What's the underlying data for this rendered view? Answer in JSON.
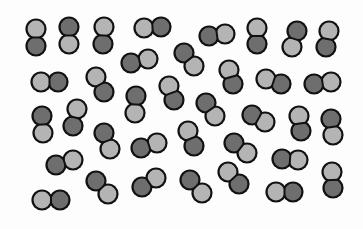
{
  "diagram": {
    "colors": {
      "light_atom": "#b4b4b4",
      "dark_atom": "#6e6e6e",
      "outline": "#111111",
      "background": "#fdfdfd"
    },
    "atom_radius": 9,
    "molecules": [
      {
        "a": {
          "x": 36,
          "y": 29,
          "c": "light"
        },
        "b": {
          "x": 36,
          "y": 46,
          "c": "dark"
        }
      },
      {
        "a": {
          "x": 69,
          "y": 27,
          "c": "dark"
        },
        "b": {
          "x": 69,
          "y": 44,
          "c": "light"
        }
      },
      {
        "a": {
          "x": 104,
          "y": 27,
          "c": "light"
        },
        "b": {
          "x": 103,
          "y": 44,
          "c": "dark"
        }
      },
      {
        "a": {
          "x": 144,
          "y": 28,
          "c": "light"
        },
        "b": {
          "x": 161,
          "y": 27,
          "c": "dark"
        }
      },
      {
        "a": {
          "x": 209,
          "y": 36,
          "c": "dark"
        },
        "b": {
          "x": 225,
          "y": 34,
          "c": "light"
        }
      },
      {
        "a": {
          "x": 257,
          "y": 28,
          "c": "light"
        },
        "b": {
          "x": 257,
          "y": 44,
          "c": "dark"
        }
      },
      {
        "a": {
          "x": 297,
          "y": 31,
          "c": "dark"
        },
        "b": {
          "x": 292,
          "y": 47,
          "c": "light"
        }
      },
      {
        "a": {
          "x": 329,
          "y": 31,
          "c": "light"
        },
        "b": {
          "x": 326,
          "y": 47,
          "c": "dark"
        }
      },
      {
        "a": {
          "x": 41,
          "y": 82,
          "c": "light"
        },
        "b": {
          "x": 58,
          "y": 82,
          "c": "dark"
        }
      },
      {
        "a": {
          "x": 96,
          "y": 77,
          "c": "light"
        },
        "b": {
          "x": 104,
          "y": 92,
          "c": "dark"
        }
      },
      {
        "a": {
          "x": 131,
          "y": 63,
          "c": "dark"
        },
        "b": {
          "x": 148,
          "y": 59,
          "c": "light"
        }
      },
      {
        "a": {
          "x": 184,
          "y": 53,
          "c": "dark"
        },
        "b": {
          "x": 194,
          "y": 66,
          "c": "light"
        }
      },
      {
        "a": {
          "x": 229,
          "y": 70,
          "c": "light"
        },
        "b": {
          "x": 233,
          "y": 84,
          "c": "dark"
        }
      },
      {
        "a": {
          "x": 266,
          "y": 79,
          "c": "light"
        },
        "b": {
          "x": 281,
          "y": 84,
          "c": "dark"
        }
      },
      {
        "a": {
          "x": 314,
          "y": 84,
          "c": "dark"
        },
        "b": {
          "x": 331,
          "y": 82,
          "c": "light"
        }
      },
      {
        "a": {
          "x": 169,
          "y": 86,
          "c": "light"
        },
        "b": {
          "x": 174,
          "y": 100,
          "c": "dark"
        }
      },
      {
        "a": {
          "x": 42,
          "y": 116,
          "c": "dark"
        },
        "b": {
          "x": 43,
          "y": 133,
          "c": "light"
        }
      },
      {
        "a": {
          "x": 77,
          "y": 109,
          "c": "light"
        },
        "b": {
          "x": 73,
          "y": 126,
          "c": "dark"
        }
      },
      {
        "a": {
          "x": 104,
          "y": 133,
          "c": "dark"
        },
        "b": {
          "x": 110,
          "y": 149,
          "c": "light"
        }
      },
      {
        "a": {
          "x": 136,
          "y": 96,
          "c": "dark"
        },
        "b": {
          "x": 135,
          "y": 113,
          "c": "light"
        }
      },
      {
        "a": {
          "x": 206,
          "y": 103,
          "c": "dark"
        },
        "b": {
          "x": 215,
          "y": 116,
          "c": "light"
        }
      },
      {
        "a": {
          "x": 252,
          "y": 115,
          "c": "dark"
        },
        "b": {
          "x": 265,
          "y": 122,
          "c": "light"
        }
      },
      {
        "a": {
          "x": 299,
          "y": 116,
          "c": "light"
        },
        "b": {
          "x": 301,
          "y": 131,
          "c": "dark"
        }
      },
      {
        "a": {
          "x": 331,
          "y": 119,
          "c": "dark"
        },
        "b": {
          "x": 333,
          "y": 135,
          "c": "light"
        }
      },
      {
        "a": {
          "x": 141,
          "y": 148,
          "c": "dark"
        },
        "b": {
          "x": 157,
          "y": 143,
          "c": "light"
        }
      },
      {
        "a": {
          "x": 188,
          "y": 131,
          "c": "light"
        },
        "b": {
          "x": 194,
          "y": 146,
          "c": "dark"
        }
      },
      {
        "a": {
          "x": 234,
          "y": 143,
          "c": "dark"
        },
        "b": {
          "x": 247,
          "y": 153,
          "c": "light"
        }
      },
      {
        "a": {
          "x": 282,
          "y": 159,
          "c": "dark"
        },
        "b": {
          "x": 298,
          "y": 160,
          "c": "light"
        }
      },
      {
        "a": {
          "x": 56,
          "y": 165,
          "c": "dark"
        },
        "b": {
          "x": 73,
          "y": 160,
          "c": "light"
        }
      },
      {
        "a": {
          "x": 96,
          "y": 181,
          "c": "dark"
        },
        "b": {
          "x": 108,
          "y": 194,
          "c": "light"
        }
      },
      {
        "a": {
          "x": 42,
          "y": 200,
          "c": "light"
        },
        "b": {
          "x": 60,
          "y": 200,
          "c": "dark"
        }
      },
      {
        "a": {
          "x": 142,
          "y": 187,
          "c": "dark"
        },
        "b": {
          "x": 156,
          "y": 178,
          "c": "light"
        }
      },
      {
        "a": {
          "x": 190,
          "y": 180,
          "c": "dark"
        },
        "b": {
          "x": 202,
          "y": 193,
          "c": "light"
        }
      },
      {
        "a": {
          "x": 228,
          "y": 172,
          "c": "light"
        },
        "b": {
          "x": 239,
          "y": 184,
          "c": "dark"
        }
      },
      {
        "a": {
          "x": 276,
          "y": 192,
          "c": "light"
        },
        "b": {
          "x": 293,
          "y": 192,
          "c": "dark"
        }
      },
      {
        "a": {
          "x": 332,
          "y": 172,
          "c": "light"
        },
        "b": {
          "x": 333,
          "y": 188,
          "c": "dark"
        }
      }
    ]
  }
}
